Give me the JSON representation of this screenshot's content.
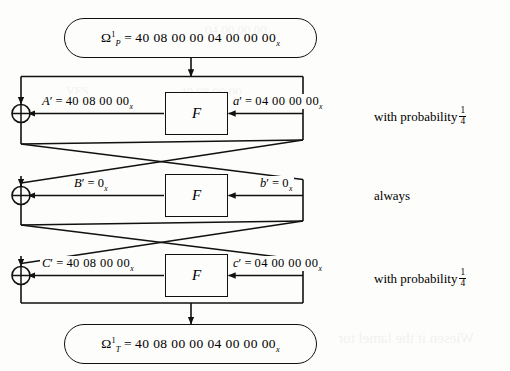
{
  "figure": {
    "type": "feistel-differential-characteristic-diagram",
    "background_color": "#fdfdfb",
    "line_color": "#111111"
  },
  "input_oval": {
    "name": "omega-p",
    "symbol": "Ω",
    "superscript": "1",
    "subscript": "P",
    "equals": "=",
    "value": "40 08 00 00   04 00 00 00",
    "value_subscript": "x",
    "full_text": "Ω¹P = 40 08 00 00  04 00 00 00x"
  },
  "output_oval": {
    "name": "omega-t",
    "symbol": "Ω",
    "superscript": "1",
    "subscript": "T",
    "equals": "=",
    "value": "40 08 00 00   04 00 00 00",
    "value_subscript": "x",
    "full_text": "Ω¹T = 40 08 00 00  04 00 00 00x"
  },
  "rounds": [
    {
      "index": 1,
      "f_label": "F",
      "left_var": "A",
      "left_prime": "′",
      "left_equals": "=",
      "left_value": "40 08 00 00",
      "left_value_subscript": "x",
      "left_full": "A′ = 40 08 00 00x",
      "right_var": "a",
      "right_prime": "′",
      "right_equals": "=",
      "right_value": "04 00 00 00",
      "right_value_subscript": "x",
      "right_full": "a′ = 04 00 00 00x",
      "note_prefix": "with probability",
      "note_fraction_numerator": "1",
      "note_fraction_denominator": "4",
      "note_full": "with probability 1/4",
      "xor_symbol": "⊕"
    },
    {
      "index": 2,
      "f_label": "F",
      "left_var": "B",
      "left_prime": "′",
      "left_equals": "=",
      "left_value": "0",
      "left_value_subscript": "x",
      "left_full": "B′ = 0x",
      "right_var": "b",
      "right_prime": "′",
      "right_equals": "=",
      "right_value": "0",
      "right_value_subscript": "x",
      "right_full": "b′ = 0x",
      "note_prefix": "always",
      "note_fraction_numerator": "",
      "note_fraction_denominator": "",
      "note_full": "always",
      "xor_symbol": "⊕"
    },
    {
      "index": 3,
      "f_label": "F",
      "left_var": "C",
      "left_prime": "′",
      "left_equals": "=",
      "left_value": "40 08 00 00",
      "left_value_subscript": "x",
      "left_full": "C′ = 40 08 00 00x",
      "right_var": "c",
      "right_prime": "′",
      "right_equals": "=",
      "right_value": "04 00 00 00",
      "right_value_subscript": "x",
      "right_full": "c′ = 04 00 00 00x",
      "note_prefix": "with probability",
      "note_fraction_numerator": "1",
      "note_fraction_denominator": "4",
      "note_full": "with probability 1/4",
      "xor_symbol": "⊕"
    }
  ],
  "ghost_text": {
    "g1": "Wiesen it the lamel tor",
    "g2": "40 08 00 00",
    "g3": "04 00 00 00",
    "g4": "VES"
  }
}
